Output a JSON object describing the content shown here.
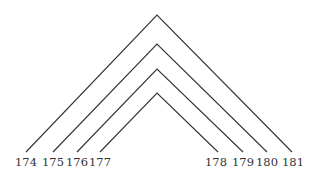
{
  "diagram": {
    "line_color": "#333333",
    "arcs": [
      {
        "left": "174",
        "right": "181",
        "apex": [
          157,
          15
        ],
        "lx": 26,
        "rx": 292
      },
      {
        "left": "175",
        "right": "180",
        "apex": [
          157,
          44
        ],
        "lx": 53,
        "rx": 267
      },
      {
        "left": "176",
        "right": "179",
        "apex": [
          157,
          69
        ],
        "lx": 77,
        "rx": 243
      },
      {
        "left": "177",
        "right": "178",
        "apex": [
          157,
          93
        ],
        "lx": 100,
        "rx": 218
      }
    ],
    "labels": [
      {
        "text": "174",
        "x": 26
      },
      {
        "text": "175",
        "x": 53
      },
      {
        "text": "176",
        "x": 77
      },
      {
        "text": "177",
        "x": 100
      },
      {
        "text": "178",
        "x": 216
      },
      {
        "text": "179",
        "x": 243
      },
      {
        "text": "180",
        "x": 267
      },
      {
        "text": "181",
        "x": 293
      }
    ]
  }
}
